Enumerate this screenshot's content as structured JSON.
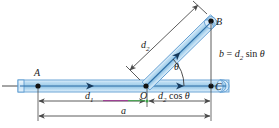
{
  "figure": {
    "background_color": "#ffffff"
  },
  "colors": {
    "rod_fill_light": "#cfe4f5",
    "rod_fill_mid": "#a8cfea",
    "rod_edge": "#5b9bd1",
    "rod_center_line": "#2f6fa8",
    "point_dot": "#111111",
    "dimension_line": "#4a4a4a",
    "label_text": "#1a1a1a",
    "highlight_magenta": "#9b2f8f",
    "highlight_green": "#3fa34a"
  },
  "points": [
    {
      "name": "A",
      "label": "A",
      "x": 38,
      "y": 86
    },
    {
      "name": "O",
      "label": "O",
      "x": 146,
      "y": 86
    },
    {
      "name": "B",
      "label": "B",
      "x": 211,
      "y": 21
    },
    {
      "name": "C",
      "label": "C",
      "x": 211,
      "y": 86
    }
  ],
  "labels": {
    "point_a": "A",
    "point_b": "B",
    "point_o": "O",
    "point_c": "C",
    "d1_main": "d",
    "d1_sub": "1",
    "d2_main": "d",
    "d2_sub": "2",
    "theta": "θ",
    "a_dim": "a",
    "b_equation_lhs": "b",
    "b_equation_eq": "=",
    "b_equation_d": "d",
    "b_equation_sub": "2",
    "b_equation_sin": "sin",
    "b_equation_theta": "θ",
    "d2cos_d": "d",
    "d2cos_sub": "2",
    "d2cos_fn": "cos",
    "d2cos_theta": "θ"
  },
  "dimensions": [
    {
      "name": "d1",
      "text": "d₁",
      "from_x": 38,
      "to_x": 146,
      "y": 101,
      "orientation": "horizontal"
    },
    {
      "name": "d2-cos-theta",
      "text": "d₂ cos θ",
      "from_x": 148,
      "to_x": 211,
      "y": 101,
      "orientation": "horizontal"
    },
    {
      "name": "a",
      "text": "a",
      "from_x": 38,
      "to_x": 211,
      "y": 116,
      "orientation": "horizontal"
    },
    {
      "name": "b",
      "text": "b = d₂ sin θ",
      "from_y": 21,
      "to_y": 86,
      "x": 211,
      "orientation": "vertical"
    },
    {
      "name": "d2",
      "text": "d₂",
      "orientation": "oblique"
    }
  ],
  "geometry": {
    "horizontal_rod": {
      "left_x": 18,
      "right_x": 229,
      "center_y": 86,
      "half_thickness": 6
    },
    "angled_rod": {
      "start_x": 146,
      "start_y": 86,
      "end_x": 214,
      "end_y": 19,
      "half_thickness": 5
    },
    "angle_theta_degrees": 44,
    "arrow_on_horizontal_rod_1_x": 93,
    "arrow_on_horizontal_rod_2_x": 183
  }
}
